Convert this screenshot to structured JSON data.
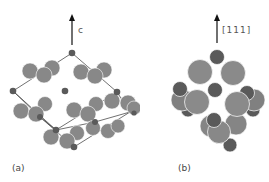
{
  "panels": {
    "a": {
      "label": "(a)",
      "axis_label": "c"
    },
    "b": {
      "label": "(b)",
      "axis_label": "[111]"
    }
  },
  "colors": {
    "large_atom": "#888888",
    "small_atom": "#5a5a5a",
    "bond_line": "#333333",
    "arrow": "#111111",
    "label_text": "#444444"
  }
}
